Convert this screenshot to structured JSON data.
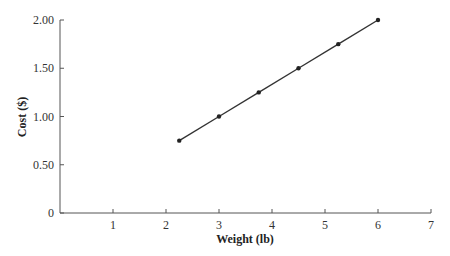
{
  "chart_data": {
    "type": "line",
    "title": "",
    "xlabel": "Weight (lb)",
    "ylabel": "Cost ($)",
    "xlim": [
      0,
      7
    ],
    "ylim": [
      0,
      2.0
    ],
    "x_ticks": [
      "1",
      "2",
      "3",
      "4",
      "5",
      "6",
      "7"
    ],
    "y_ticks": [
      "0",
      "0.50",
      "1.00",
      "1.50",
      "2.00"
    ],
    "grid": false,
    "legend": null,
    "series": [
      {
        "name": "Cost",
        "x": [
          2.25,
          3.0,
          3.75,
          4.5,
          5.25,
          6.0
        ],
        "y": [
          0.75,
          1.0,
          1.25,
          1.5,
          1.75,
          2.0
        ]
      }
    ]
  }
}
